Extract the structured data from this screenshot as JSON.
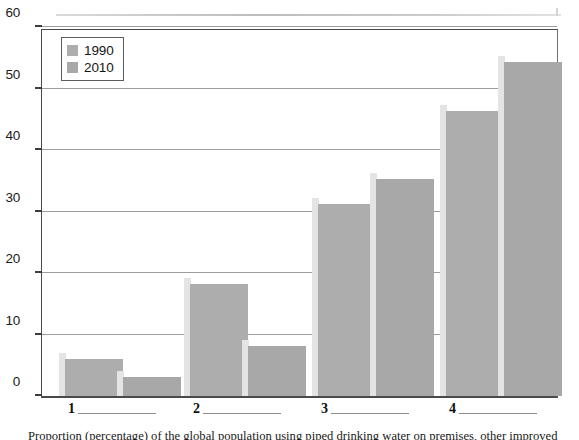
{
  "chart_data": {
    "type": "bar",
    "title": "",
    "subtitle": "",
    "xlabel": "",
    "ylabel": "",
    "ylim": [
      0,
      60
    ],
    "yticks": [
      0,
      10,
      20,
      30,
      40,
      50,
      60
    ],
    "ytick_labels": [
      "0",
      "10",
      "20",
      "30",
      "40",
      "50",
      "60"
    ],
    "grid": true,
    "legend_position": "upper left",
    "categories": [
      "1",
      "2",
      "3",
      "4"
    ],
    "series": [
      {
        "name": "1990",
        "color": "#adadad",
        "values": [
          6.0,
          18.2,
          31.2,
          46.3
        ]
      },
      {
        "name": "2010",
        "color": "#a8a8a8",
        "values": [
          3.1,
          8.2,
          35.3,
          54.3
        ]
      }
    ],
    "annotations": []
  },
  "legend": {
    "entries": [
      {
        "label": "1990",
        "swatch_color": "#adadad",
        "swatch_name": "legend-swatch-1990"
      },
      {
        "label": "2010",
        "swatch_color": "#a8a8a8",
        "swatch_name": "legend-swatch-2010"
      }
    ]
  },
  "axis": {
    "y_labels": [
      "60",
      "50",
      "40",
      "30",
      "20",
      "10",
      "0"
    ],
    "x_labels": [
      "1",
      "2",
      "3",
      "4"
    ]
  },
  "caption": {
    "text": "Proportion (percentage) of the global population using piped drinking water on premises, other improved"
  }
}
